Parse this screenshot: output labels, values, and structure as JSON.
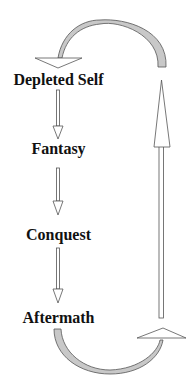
{
  "diagram": {
    "type": "cycle",
    "stages": [
      {
        "label": "Depleted Self",
        "top": 71
      },
      {
        "label": "Fantasy",
        "top": 140
      },
      {
        "label": "Conquest",
        "top": 226
      },
      {
        "label": "Aftermath",
        "top": 309
      }
    ],
    "colors": {
      "stroke": "#555555",
      "arc_fill": "#c8c8c8",
      "text": "#111111",
      "background": "#ffffff"
    }
  }
}
